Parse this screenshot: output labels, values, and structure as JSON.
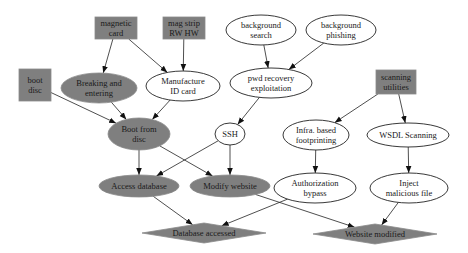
{
  "diagram": {
    "type": "attack-graph",
    "colors": {
      "filled_node": "#7f7f7f",
      "open_node": "#ffffff",
      "edge": "#222222"
    },
    "nodes": [
      {
        "id": "magnetic_card",
        "lines": [
          "magnetic",
          "card"
        ],
        "shape": "box",
        "filled": true
      },
      {
        "id": "mag_strip",
        "lines": [
          "mag strip",
          "RW HW"
        ],
        "shape": "box",
        "filled": true
      },
      {
        "id": "boot_disc",
        "lines": [
          "boot",
          "disc"
        ],
        "shape": "box",
        "filled": true
      },
      {
        "id": "breaking",
        "lines": [
          "Breaking and",
          "entering"
        ],
        "shape": "ellipse",
        "filled": true
      },
      {
        "id": "manufacture",
        "lines": [
          "Manufacture",
          "ID card"
        ],
        "shape": "ellipse",
        "filled": false
      },
      {
        "id": "bg_search",
        "lines": [
          "background",
          "search"
        ],
        "shape": "ellipse",
        "filled": false
      },
      {
        "id": "bg_phishing",
        "lines": [
          "background",
          "phishing"
        ],
        "shape": "ellipse",
        "filled": false
      },
      {
        "id": "pwd_recovery",
        "lines": [
          "pwd recovery",
          "exploitation"
        ],
        "shape": "ellipse",
        "filled": false
      },
      {
        "id": "scanning",
        "lines": [
          "scanning",
          "utilities"
        ],
        "shape": "box",
        "filled": true
      },
      {
        "id": "boot_from_disc",
        "lines": [
          "Boot from",
          "disc"
        ],
        "shape": "ellipse",
        "filled": true
      },
      {
        "id": "ssh",
        "lines": [
          "SSH"
        ],
        "shape": "ellipse",
        "filled": false
      },
      {
        "id": "infra",
        "lines": [
          "Infra. based",
          "footprinting"
        ],
        "shape": "ellipse",
        "filled": false
      },
      {
        "id": "wsdl",
        "lines": [
          "WSDL Scanning"
        ],
        "shape": "ellipse",
        "filled": false
      },
      {
        "id": "access_db",
        "lines": [
          "Access database"
        ],
        "shape": "ellipse",
        "filled": true
      },
      {
        "id": "modify_web",
        "lines": [
          "Modify website"
        ],
        "shape": "ellipse",
        "filled": true
      },
      {
        "id": "auth_bypass",
        "lines": [
          "Authorization",
          "bypass"
        ],
        "shape": "ellipse",
        "filled": false
      },
      {
        "id": "inject",
        "lines": [
          "Inject",
          "malicious file"
        ],
        "shape": "ellipse",
        "filled": false
      },
      {
        "id": "db_accessed",
        "lines": [
          "Database accessed"
        ],
        "shape": "diamond",
        "filled": true
      },
      {
        "id": "web_modified",
        "lines": [
          "Website modified"
        ],
        "shape": "diamond",
        "filled": true
      }
    ],
    "edges": [
      {
        "from": "magnetic_card",
        "to": "breaking"
      },
      {
        "from": "magnetic_card",
        "to": "manufacture"
      },
      {
        "from": "mag_strip",
        "to": "manufacture"
      },
      {
        "from": "boot_disc",
        "to": "boot_from_disc"
      },
      {
        "from": "breaking",
        "to": "boot_from_disc"
      },
      {
        "from": "manufacture",
        "to": "boot_from_disc"
      },
      {
        "from": "bg_search",
        "to": "pwd_recovery"
      },
      {
        "from": "bg_phishing",
        "to": "pwd_recovery"
      },
      {
        "from": "pwd_recovery",
        "to": "ssh"
      },
      {
        "from": "scanning",
        "to": "infra"
      },
      {
        "from": "scanning",
        "to": "wsdl"
      },
      {
        "from": "boot_from_disc",
        "to": "access_db"
      },
      {
        "from": "boot_from_disc",
        "to": "modify_web"
      },
      {
        "from": "ssh",
        "to": "access_db"
      },
      {
        "from": "ssh",
        "to": "modify_web"
      },
      {
        "from": "infra",
        "to": "auth_bypass"
      },
      {
        "from": "wsdl",
        "to": "inject"
      },
      {
        "from": "access_db",
        "to": "db_accessed"
      },
      {
        "from": "auth_bypass",
        "to": "db_accessed"
      },
      {
        "from": "modify_web",
        "to": "web_modified"
      },
      {
        "from": "inject",
        "to": "web_modified"
      }
    ]
  }
}
